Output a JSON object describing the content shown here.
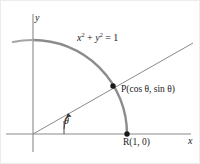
{
  "figure": {
    "axes": {
      "x_label": "x",
      "y_label": "y"
    },
    "labels": {
      "circle_equation_lhs_base1": "x",
      "circle_equation_exp1": "2",
      "circle_equation_plus": " + ",
      "circle_equation_lhs_base2": "y",
      "circle_equation_exp2": "2",
      "circle_equation_rhs": " = 1",
      "point_p": "P(cos θ, sin θ)",
      "point_r": "R(1, 0)",
      "angle": "θ"
    },
    "colors": {
      "arc": "#8c8c8c",
      "axis": "#8a8a8a",
      "ray": "#8a8a8a",
      "point": "#1a1a1a",
      "text": "#1a1a1a",
      "border": "#e8e8e8",
      "background": "#ffffff"
    },
    "geometry": {
      "origin": [
        33,
        134
      ],
      "point_p": [
        113,
        86
      ],
      "point_r": [
        127,
        134
      ],
      "radius_px": 94,
      "ray_end": [
        193,
        43
      ],
      "arc_start_angle_deg": 155,
      "arc_end_angle_deg": 0
    }
  }
}
